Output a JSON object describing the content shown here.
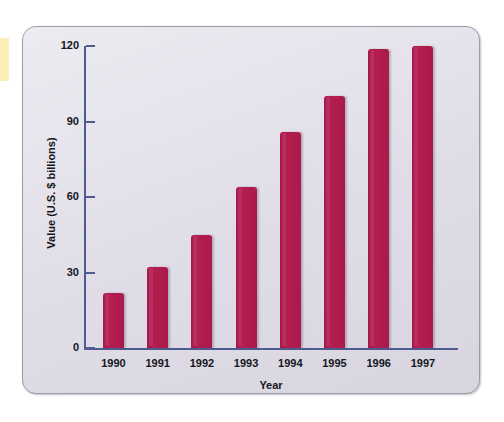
{
  "chart_data": {
    "type": "bar",
    "title": "",
    "xlabel": "Year",
    "ylabel": "Value (U.S. $ billions)",
    "categories": [
      "1990",
      "1991",
      "1992",
      "1993",
      "1994",
      "1995",
      "1996",
      "1997"
    ],
    "values": [
      22,
      32,
      45,
      64,
      86,
      100,
      119,
      120
    ],
    "ylim": [
      0,
      120
    ],
    "yticks": [
      "0",
      "30",
      "60",
      "90",
      "120"
    ],
    "ytick_values": [
      0,
      30,
      60,
      90,
      120
    ],
    "grid": false,
    "legend": null,
    "series": [
      {
        "name": "Value (U.S. $ billions)",
        "values": [
          22,
          32,
          45,
          64,
          86,
          100,
          119,
          120
        ],
        "color": "#b01c4e"
      }
    ]
  },
  "colors": {
    "bar": "#b01c4e",
    "axis": "#4e5b8e",
    "panel_background": "#dedbe6",
    "panel_border": "#9d9aa8",
    "page_background": "#ffffff",
    "edge_strip": "#faeeb9",
    "text": "#141620"
  },
  "axis": {
    "y_title": "Value (U.S. $ billions)",
    "x_title": "Year",
    "y_ticks": [
      "120",
      "90",
      "60",
      "30",
      "0"
    ],
    "x_ticks": [
      "1990",
      "1991",
      "1992",
      "1993",
      "1994",
      "1995",
      "1996",
      "1997"
    ]
  }
}
